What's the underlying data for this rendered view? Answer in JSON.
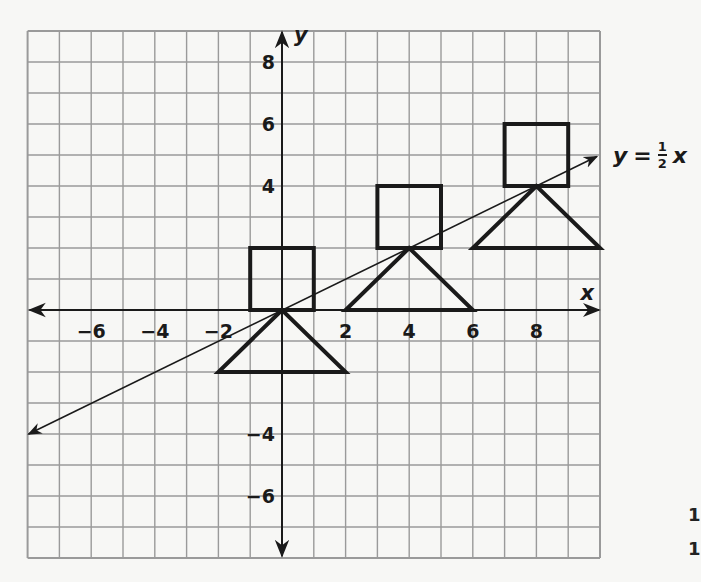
{
  "diagram": {
    "type": "coordinate-plane",
    "grid": {
      "x_min": -8,
      "x_max": 10,
      "y_min": -8,
      "y_max": 9,
      "step": 1
    },
    "axes": {
      "x_label": "x",
      "y_label": "y",
      "x_ticks": [
        {
          "value": -6,
          "label": "−6"
        },
        {
          "value": -4,
          "label": "−4"
        },
        {
          "value": -2,
          "label": "−2"
        },
        {
          "value": 2,
          "label": "2"
        },
        {
          "value": 4,
          "label": "4"
        },
        {
          "value": 6,
          "label": "6"
        },
        {
          "value": 8,
          "label": "8"
        }
      ],
      "y_ticks": [
        {
          "value": 8,
          "label": "8"
        },
        {
          "value": 6,
          "label": "6"
        },
        {
          "value": 4,
          "label": "4"
        },
        {
          "value": -4,
          "label": "−4"
        },
        {
          "value": -6,
          "label": "−6"
        }
      ]
    },
    "line": {
      "equation_lhs": "y",
      "equation_eq": "=",
      "frac_num": "1",
      "frac_den": "2",
      "equation_var": "x",
      "from": [
        -8,
        -4
      ],
      "to": [
        9.9,
        4.95
      ]
    },
    "squares": [
      {
        "x1": -1,
        "y1": 0,
        "x2": 1,
        "y2": 2
      },
      {
        "x1": 3,
        "y1": 2,
        "x2": 5,
        "y2": 4
      },
      {
        "x1": 7,
        "y1": 4,
        "x2": 9,
        "y2": 6
      }
    ],
    "triangles": [
      {
        "apex": [
          0,
          0
        ],
        "base_left": [
          -2,
          -2
        ],
        "base_right": [
          2,
          -2
        ]
      },
      {
        "apex": [
          4,
          2
        ],
        "base_left": [
          2,
          0
        ],
        "base_right": [
          6,
          0
        ]
      },
      {
        "apex": [
          8,
          4
        ],
        "base_left": [
          6,
          2
        ],
        "base_right": [
          10,
          2
        ]
      }
    ],
    "edge_glyphs": [
      "1",
      "1"
    ]
  },
  "colors": {
    "grid": "#9a9a9a",
    "ink": "#1a1a1a",
    "paper": "#f7f7f5"
  }
}
